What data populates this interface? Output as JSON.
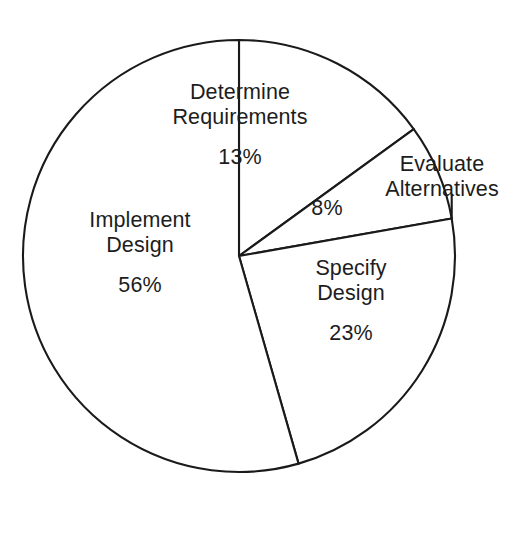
{
  "chart_data": {
    "type": "pie",
    "title": "",
    "subtitle": "",
    "xlabel": "",
    "ylabel": "",
    "legend": "none",
    "grid": false,
    "units": "percent",
    "total": 100,
    "start_angle_deg": 0,
    "direction": "clockwise",
    "categories": [
      "Determine Requirements",
      "Evaluate Alternatives",
      "Specify Design",
      "Implement Design"
    ],
    "values": [
      13,
      8,
      23,
      56
    ],
    "slices": [
      {
        "label": "Determine Requirements",
        "label_line1": "Determine",
        "label_line2": "Requirements",
        "value": 13,
        "value_text": "13%",
        "start_deg": 0,
        "end_deg": 54,
        "label_placement": "inside"
      },
      {
        "label": "Evaluate Alternatives",
        "label_line1": "Evaluate",
        "label_line2": "Alternatives",
        "value": 8,
        "value_text": "8%",
        "start_deg": 54,
        "end_deg": 80,
        "label_placement": "outside"
      },
      {
        "label": "Specify Design",
        "label_line1": "Specify",
        "label_line2": "Design",
        "value": 23,
        "value_text": "23%",
        "start_deg": 80,
        "end_deg": 164,
        "label_placement": "inside"
      },
      {
        "label": "Implement Design",
        "label_line1": "Implement",
        "label_line2": "Design",
        "value": 56,
        "value_text": "56%",
        "start_deg": 164,
        "end_deg": 360,
        "label_placement": "inside"
      }
    ]
  },
  "style": {
    "background": "#ffffff",
    "stroke": "#1a1a1a",
    "slice_fill": "#ffffff",
    "text": "#1d1d1d"
  },
  "geometry": {
    "center_x": 239,
    "center_y": 256,
    "radius": 216
  }
}
